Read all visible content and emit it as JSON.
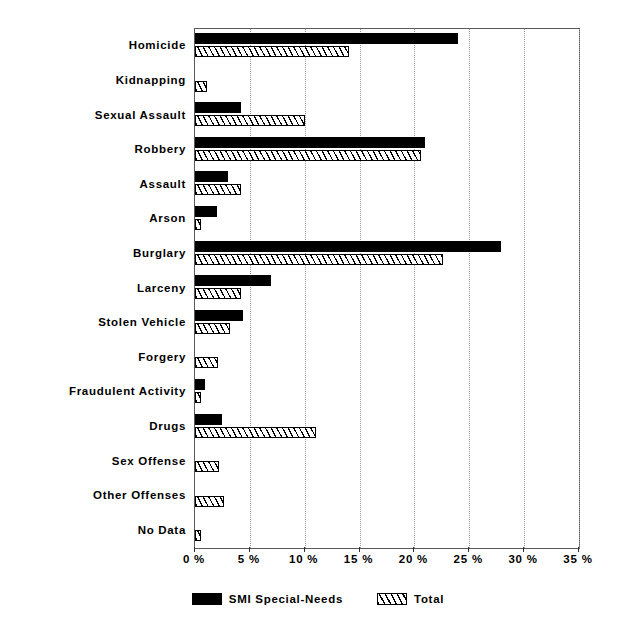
{
  "chart_data": {
    "type": "bar",
    "orientation": "horizontal",
    "title": "",
    "xlabel": "",
    "ylabel": "",
    "xlim": [
      0,
      35
    ],
    "xtick_labels": [
      "0 %",
      "5 %",
      "10 %",
      "15 %",
      "20 %",
      "25 %",
      "30 %",
      "35 %"
    ],
    "xtick_values": [
      0,
      5,
      10,
      15,
      20,
      25,
      30,
      35
    ],
    "grid": "vertical-dotted",
    "legend_position": "bottom-center",
    "categories": [
      "Homicide",
      "Kidnapping",
      "Sexual Assault",
      "Robbery",
      "Assault",
      "Arson",
      "Burglary",
      "Larceny",
      "Stolen Vehicle",
      "Forgery",
      "Fraudulent Activity",
      "Drugs",
      "Sex Offense",
      "Other Offenses",
      "No Data"
    ],
    "series": [
      {
        "name": "SMI Special-Needs",
        "color": "#000000",
        "fill": "solid-black",
        "values": [
          24.0,
          0.0,
          4.2,
          21.0,
          3.0,
          2.0,
          27.9,
          6.9,
          4.4,
          0.0,
          0.9,
          2.5,
          0.0,
          0.0,
          0.0
        ]
      },
      {
        "name": "Total",
        "color": "#000000",
        "fill": "diagonal-hatch",
        "values": [
          14.0,
          1.1,
          10.0,
          20.6,
          4.2,
          0.3,
          22.6,
          4.2,
          3.2,
          2.1,
          0.5,
          11.0,
          2.2,
          2.6,
          0.5
        ]
      }
    ]
  },
  "legend": {
    "entries": [
      {
        "label": "SMI Special-Needs",
        "swatch": "solid-black-swatch"
      },
      {
        "label": "Total",
        "swatch": "hatched-swatch"
      }
    ]
  }
}
